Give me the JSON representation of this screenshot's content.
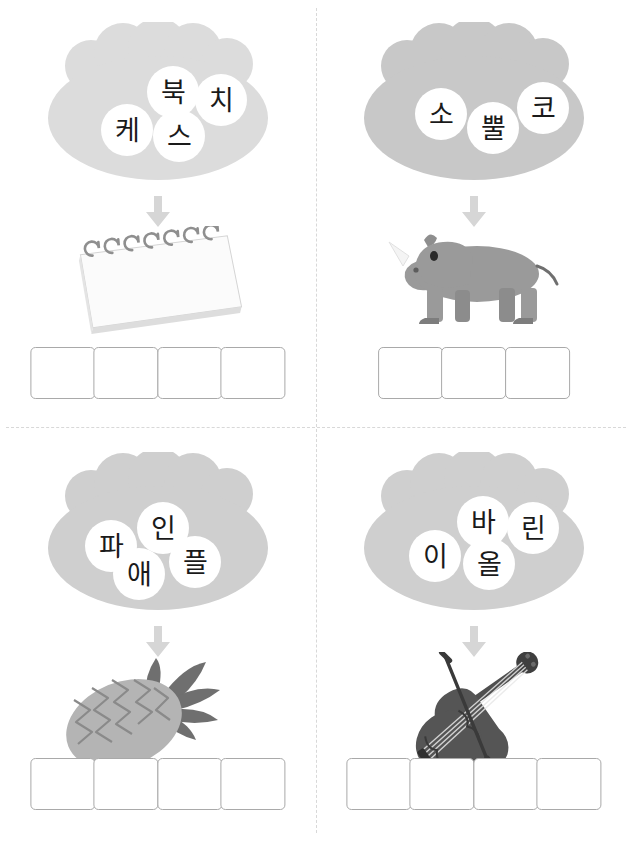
{
  "worksheet": {
    "title": "Korean syllable-assembly worksheet",
    "layout": "2x2 grid of puzzle cells separated by dashed lines",
    "colors": {
      "blob_fill": "#dcdcdc",
      "blob_fill_light": "#e2e2e2",
      "syllable_circle": "#ffffff",
      "syllable_text": "#1a1a1a",
      "arrow": "#d6d6d6",
      "box_border": "#a9a9a9",
      "divider": "#d8d8d8",
      "page_background": "#ffffff",
      "rhino_body": "#9a9a9a",
      "pineapple_body": "#b4b4b4",
      "pineapple_leaves": "#6f6f6f",
      "violin_body": "#555555",
      "notebook_paper": "#fbfbfb"
    },
    "cells": [
      {
        "id": "cell-sketchbook",
        "position": "top-left",
        "syllables": [
          {
            "text": "북",
            "x": 104,
            "y": 44
          },
          {
            "text": "치",
            "x": 152,
            "y": 52
          },
          {
            "text": "케",
            "x": 58,
            "y": 82
          },
          {
            "text": "스",
            "x": 110,
            "y": 88
          }
        ],
        "picture": {
          "name": "sketchbook-illustration",
          "label": "spiral-bound sketchbook"
        },
        "answer_boxes": 4,
        "answer_word": "스케치북"
      },
      {
        "id": "cell-rhinoceros",
        "position": "top-right",
        "syllables": [
          {
            "text": "소",
            "x": 56,
            "y": 66
          },
          {
            "text": "뿔",
            "x": 108,
            "y": 80
          },
          {
            "text": "코",
            "x": 158,
            "y": 60
          }
        ],
        "picture": {
          "name": "rhinoceros-illustration",
          "label": "gray rhinoceros"
        },
        "answer_boxes": 3,
        "answer_word": "코뿔소"
      },
      {
        "id": "cell-pineapple",
        "position": "bottom-left",
        "syllables": [
          {
            "text": "파",
            "x": 42,
            "y": 68
          },
          {
            "text": "인",
            "x": 94,
            "y": 50
          },
          {
            "text": "애",
            "x": 70,
            "y": 96
          },
          {
            "text": "플",
            "x": 126,
            "y": 84
          }
        ],
        "picture": {
          "name": "pineapple-illustration",
          "label": "pineapple"
        },
        "answer_boxes": 4,
        "answer_word": "파인애플"
      },
      {
        "id": "cell-violin",
        "position": "bottom-right",
        "syllables": [
          {
            "text": "바",
            "x": 98,
            "y": 44
          },
          {
            "text": "린",
            "x": 148,
            "y": 50
          },
          {
            "text": "이",
            "x": 50,
            "y": 78
          },
          {
            "text": "올",
            "x": 104,
            "y": 86
          }
        ],
        "picture": {
          "name": "violin-illustration",
          "label": "violin with bow"
        },
        "answer_boxes": 4,
        "answer_word": "바이올린"
      }
    ]
  }
}
